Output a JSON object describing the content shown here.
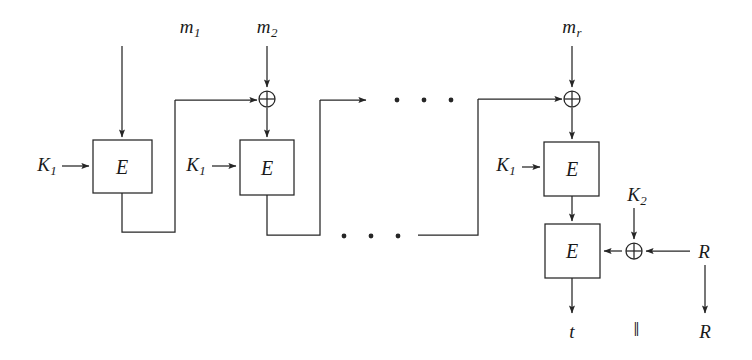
{
  "diagram": {
    "stroke_color": "#262626",
    "text_color": "#1a1a1a",
    "background": "#ffffff",
    "message_inputs": [
      {
        "id": "m1",
        "base": "m",
        "sub": "1",
        "x": 190,
        "y": 28
      },
      {
        "id": "m2",
        "base": "m",
        "sub": "2",
        "x": 267,
        "y": 28
      },
      {
        "id": "mr",
        "base": "m",
        "sub": "r",
        "x": 572,
        "y": 28
      }
    ],
    "key_inputs": [
      {
        "id": "k1-a",
        "base": "K",
        "sub": "1",
        "x": 47,
        "y": 166
      },
      {
        "id": "k1-b",
        "base": "K",
        "sub": "1",
        "x": 196,
        "y": 166
      },
      {
        "id": "k1-c",
        "base": "K",
        "sub": "1",
        "x": 506,
        "y": 166
      },
      {
        "id": "k2",
        "base": "K",
        "sub": "2",
        "x": 637,
        "y": 196
      }
    ],
    "cipher_blocks": [
      {
        "id": "e1",
        "label": "E",
        "x": 93,
        "y": 140,
        "w": 59,
        "h": 53
      },
      {
        "id": "e2",
        "label": "E",
        "x": 240,
        "y": 140,
        "w": 54,
        "h": 55
      },
      {
        "id": "e3",
        "label": "E",
        "x": 544,
        "y": 142,
        "w": 55,
        "h": 54
      },
      {
        "id": "e4",
        "label": "E",
        "x": 545,
        "y": 224,
        "w": 55,
        "h": 54
      }
    ],
    "xor_gates": [
      {
        "id": "xor-1",
        "label": "xor-plus",
        "cx": 267,
        "cy": 99,
        "r": 8
      },
      {
        "id": "xor-2",
        "label": "xor-plus",
        "cx": 572,
        "cy": 99,
        "r": 8
      },
      {
        "id": "xor-3",
        "label": "xor-plus",
        "cx": 634,
        "cy": 251,
        "r": 8
      }
    ],
    "ellipsis": {
      "upper": {
        "y": 100,
        "xs": [
          397,
          424,
          451
        ]
      },
      "lower": {
        "y": 236,
        "xs": [
          344,
          371,
          398
        ]
      },
      "dot_radius": 2.4
    },
    "random_input": {
      "label": "R",
      "x": 704,
      "y": 251
    },
    "outputs": [
      {
        "id": "tag",
        "label": "t",
        "x": 572,
        "y": 331
      },
      {
        "id": "concat",
        "label": "‖",
        "x": 637,
        "y": 329
      },
      {
        "id": "random-out",
        "label": "R",
        "x": 705,
        "y": 331
      }
    ]
  }
}
